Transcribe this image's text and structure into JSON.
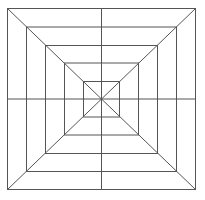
{
  "diagram": {
    "type": "concentric-squares-web",
    "stroke_color": "#555555",
    "background": "#ffffff",
    "center": [
      101.5,
      99
    ],
    "squares": [
      {
        "x1": 7.5,
        "y1": 8.5,
        "x2": 195.5,
        "y2": 189.5
      },
      {
        "x1": 26.5,
        "y1": 27,
        "x2": 176.5,
        "y2": 171.5
      },
      {
        "x1": 45.5,
        "y1": 45.5,
        "x2": 157.5,
        "y2": 153.5
      },
      {
        "x1": 64.5,
        "y1": 63,
        "x2": 138.5,
        "y2": 135
      },
      {
        "x1": 83.5,
        "y1": 81.5,
        "x2": 119.5,
        "y2": 117
      }
    ],
    "spokes": [
      "diagonal-tl-br",
      "diagonal-tr-bl",
      "vertical",
      "horizontal"
    ]
  }
}
